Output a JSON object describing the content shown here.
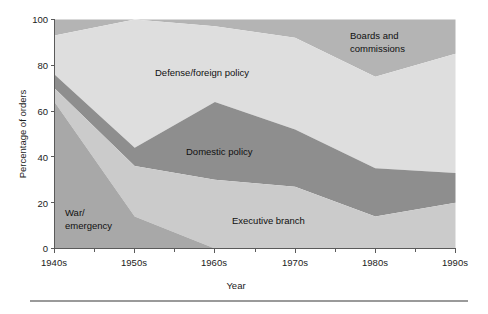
{
  "chart_data": {
    "type": "area",
    "stacked": true,
    "title": "",
    "xlabel": "Year",
    "ylabel": "Percentage of orders",
    "categories": [
      "1940s",
      "1950s",
      "1960s",
      "1970s",
      "1980s",
      "1990s"
    ],
    "x_tick_labels": [
      "1940s",
      "1950s",
      "1960s",
      "1970s",
      "1980s",
      "1990s"
    ],
    "y_tick_labels": [
      "0",
      "20",
      "40",
      "60",
      "80",
      "100"
    ],
    "y_ticks": [
      0,
      20,
      40,
      60,
      80,
      100
    ],
    "ylim": [
      0,
      100
    ],
    "grid": false,
    "legend": "inline-labels",
    "minor_ticks_between_majors": 1,
    "series": [
      {
        "name": "War/emergency",
        "label": "War/\nemergency",
        "color": "#a8a8a8",
        "values": [
          64,
          14,
          0,
          0,
          0,
          0
        ]
      },
      {
        "name": "Executive branch",
        "label": "Executive branch",
        "color": "#cbcbcb",
        "values": [
          6,
          22,
          30,
          27,
          14,
          20
        ]
      },
      {
        "name": "Domestic policy",
        "label": "Domestic policy",
        "color": "#8e8e8e",
        "values": [
          6,
          8,
          34,
          25,
          21,
          13
        ]
      },
      {
        "name": "Defense/foreign policy",
        "label": "Defense/foreign policy",
        "color": "#dedede",
        "values": [
          17,
          56,
          33,
          40,
          40,
          52
        ]
      },
      {
        "name": "Boards and commissions",
        "label": "Boards and\ncommissions",
        "color": "#b4b4b4",
        "values": [
          7,
          0,
          3,
          8,
          25,
          15
        ]
      }
    ],
    "cumulative_tops": {
      "war_emergency": [
        64,
        14,
        0,
        0,
        0,
        0
      ],
      "executive_branch": [
        70,
        36,
        30,
        27,
        14,
        20
      ],
      "domestic_policy": [
        76,
        44,
        64,
        52,
        35,
        33
      ],
      "defense_foreign_policy": [
        93,
        100,
        97,
        92,
        75,
        85
      ],
      "boards_and_commissions": [
        100,
        100,
        100,
        100,
        100,
        100
      ]
    },
    "annotations": [
      {
        "name": "boards-and-commissions-label",
        "text_line1": "Boards and",
        "text_line2": "commissions"
      },
      {
        "name": "defense-foreign-policy-label",
        "text_line1": "Defense/foreign policy",
        "text_line2": ""
      },
      {
        "name": "domestic-policy-label",
        "text_line1": "Domestic policy",
        "text_line2": ""
      },
      {
        "name": "executive-branch-label",
        "text_line1": "Executive branch",
        "text_line2": ""
      },
      {
        "name": "war-emergency-label",
        "text_line1": "War/",
        "text_line2": "emergency"
      }
    ]
  },
  "axes": {
    "y_title": "Percentage of orders",
    "x_title": "Year",
    "y_labels": [
      "100",
      "80",
      "60",
      "40",
      "20",
      "0"
    ],
    "x_labels": [
      "1940s",
      "1950s",
      "1960s",
      "1970s",
      "1980s",
      "1990s"
    ]
  },
  "colors": {
    "war_emergency": "#a8a8a8",
    "executive_branch": "#cbcbcb",
    "domestic_policy": "#8e8e8e",
    "defense_foreign_policy": "#dedede",
    "boards_and_commissions": "#b4b4b4",
    "axis": "#5a5a5a",
    "text": "#101010",
    "rule": "#9a9a9a",
    "background": "#ffffff"
  }
}
